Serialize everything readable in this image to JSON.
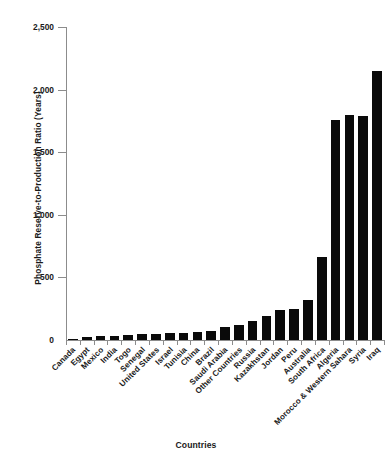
{
  "chart_data": {
    "type": "bar",
    "title": "",
    "xlabel": "Countries",
    "ylabel": "Phosphate Reserve-to-Production Ratio (Years)",
    "ylim": [
      0,
      2500
    ],
    "yticks": [
      0,
      500,
      1000,
      1500,
      2000,
      2500
    ],
    "ytick_labels": [
      "0",
      "500",
      "1,000",
      "1,500",
      "2,000",
      "2,500"
    ],
    "grid": false,
    "legend": "none",
    "bar_color": "#0a0a0a",
    "categories": [
      "Canada",
      "Egypt",
      "Mexico",
      "India",
      "Togo",
      "Senegal",
      "United States",
      "Israel",
      "Tunisia",
      "China",
      "Brazil",
      "Saudi Arabia",
      "Other Countries",
      "Russia",
      "Kazakhstan",
      "Jordan",
      "Peru",
      "Australia",
      "South Africa",
      "Algeria",
      "Morocco & Western Sahara",
      "Syria",
      "Iraq"
    ],
    "values": [
      10,
      25,
      30,
      35,
      40,
      45,
      50,
      55,
      60,
      65,
      75,
      100,
      120,
      150,
      190,
      240,
      250,
      320,
      660,
      1760,
      1800,
      1790,
      2150
    ]
  }
}
